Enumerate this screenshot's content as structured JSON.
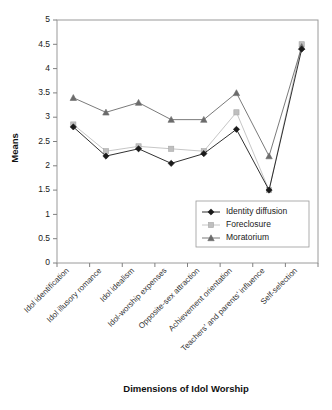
{
  "chart_data": {
    "type": "line",
    "title": "",
    "xlabel": "Dimensions of Idol Worship",
    "ylabel": "Means",
    "ylim": [
      0,
      5
    ],
    "ytick_step": 0.5,
    "yticks": [
      "0",
      "0.5",
      "1",
      "1.5",
      "2",
      "2.5",
      "3",
      "3.5",
      "4",
      "4.5",
      "5"
    ],
    "grid": false,
    "legend_position": "inside-lower-right",
    "categories": [
      "Idol identification",
      "Idol illusory romance",
      "Idol idealism",
      "Idol-worship expenses",
      "Opposite-sex attraction",
      "Achievement orientation",
      "Teachers' and parents' influence",
      "Self-selection"
    ],
    "series": [
      {
        "name": "Identity diffusion",
        "marker": "diamond",
        "color": "#1a1a1a",
        "values": [
          2.8,
          2.2,
          2.35,
          2.05,
          2.25,
          2.75,
          1.5,
          4.4
        ]
      },
      {
        "name": "Foreclosure",
        "marker": "square",
        "color": "#bfbfbf",
        "values": [
          2.85,
          2.3,
          2.4,
          2.35,
          2.3,
          3.1,
          1.5,
          4.5
        ]
      },
      {
        "name": "Moratorium",
        "marker": "triangle",
        "color": "#6b6b6b",
        "values": [
          3.4,
          3.1,
          3.3,
          2.95,
          2.95,
          3.5,
          2.2,
          4.45
        ]
      }
    ]
  }
}
